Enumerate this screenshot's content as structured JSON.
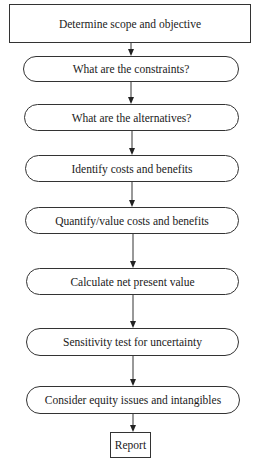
{
  "diagram": {
    "type": "flowchart",
    "direction": "top-to-bottom",
    "nodes": [
      {
        "id": "n1",
        "shape": "rectangle",
        "label": "Determine scope and objective"
      },
      {
        "id": "n2",
        "shape": "rounded",
        "label": "What are the constraints?"
      },
      {
        "id": "n3",
        "shape": "rounded",
        "label": "What are the alternatives?"
      },
      {
        "id": "n4",
        "shape": "rounded",
        "label": "Identify costs and benefits"
      },
      {
        "id": "n5",
        "shape": "rounded",
        "label": "Quantify/value costs and benefits"
      },
      {
        "id": "n6",
        "shape": "rounded",
        "label": "Calculate net present value"
      },
      {
        "id": "n7",
        "shape": "rounded",
        "label": "Sensitivity test for uncertainty"
      },
      {
        "id": "n8",
        "shape": "rounded",
        "label": "Consider equity issues and intangibles"
      },
      {
        "id": "n9",
        "shape": "rectangle",
        "label": "Report"
      }
    ],
    "edges": [
      {
        "from": "n1",
        "to": "n2"
      },
      {
        "from": "n2",
        "to": "n3"
      },
      {
        "from": "n3",
        "to": "n4"
      },
      {
        "from": "n4",
        "to": "n5"
      },
      {
        "from": "n5",
        "to": "n6"
      },
      {
        "from": "n6",
        "to": "n7"
      },
      {
        "from": "n7",
        "to": "n8"
      },
      {
        "from": "n8",
        "to": "n9"
      }
    ]
  }
}
